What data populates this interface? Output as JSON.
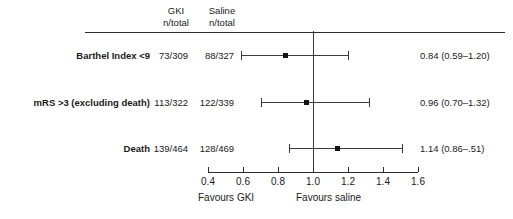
{
  "chart_data": {
    "type": "forest",
    "title": "",
    "xlabel": "",
    "ylabel": "",
    "xlim": [
      0.4,
      1.6
    ],
    "null_value": 1.0,
    "grid": false,
    "axis_ticks": [
      "0.4",
      "0.6",
      "0.8",
      "1.0",
      "1.2",
      "1.4",
      "1.6"
    ],
    "axis_tick_values": [
      0.4,
      0.6,
      0.8,
      1.0,
      1.2,
      1.4,
      1.6
    ],
    "favours_left": "Favours GKI",
    "favours_right": "Favours saline",
    "columns": {
      "outcome": "",
      "treatment_header_line1": "GKI",
      "treatment_header_line2": "n/total",
      "control_header_line1": "Saline",
      "control_header_line2": "n/total",
      "estimate_header": ""
    },
    "rows": [
      {
        "label": "Barthel Index <9",
        "gki": "73/309",
        "saline": "88/327",
        "estimate": 0.84,
        "ci_low": 0.59,
        "ci_high": 1.2,
        "estimate_text": "0.84 (0.59–1.20)"
      },
      {
        "label": "mRS >3 (excluding death)",
        "gki": "113/322",
        "saline": "122/339",
        "estimate": 0.96,
        "ci_low": 0.7,
        "ci_high": 1.32,
        "estimate_text": "0.96 (0.70–1.32)"
      },
      {
        "label": "Death",
        "gki": "139/464",
        "saline": "128/469",
        "estimate": 1.14,
        "ci_low": 0.86,
        "ci_high": 1.51,
        "estimate_text": "1.14 (0.86–.51)"
      }
    ]
  },
  "colors": {
    "marker": "#151515",
    "line": "#3a3a3a",
    "rule": "#2b2b2b",
    "text": "#1a1a1a",
    "background": "#ffffff"
  }
}
